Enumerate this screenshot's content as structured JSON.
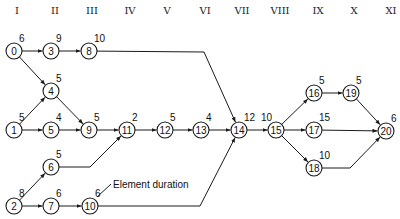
{
  "figure": {
    "annotation": {
      "text": "Element duration",
      "x": 113,
      "y": 188,
      "leader_from": [
        111,
        184
      ],
      "leader_to": [
        97,
        197
      ]
    }
  },
  "phases": [
    {
      "label": "I",
      "x": 17
    },
    {
      "label": "II",
      "x": 55
    },
    {
      "label": "III",
      "x": 92
    },
    {
      "label": "IV",
      "x": 130
    },
    {
      "label": "V",
      "x": 167
    },
    {
      "label": "VI",
      "x": 205
    },
    {
      "label": "VII",
      "x": 242
    },
    {
      "label": "VIII",
      "x": 280
    },
    {
      "label": "IX",
      "x": 318
    },
    {
      "label": "X",
      "x": 354
    },
    {
      "label": "XI",
      "x": 391
    }
  ],
  "nodes": [
    {
      "id": "0",
      "x": 14,
      "y": 51,
      "duration": "6"
    },
    {
      "id": "3",
      "x": 51,
      "y": 51,
      "duration": "9"
    },
    {
      "id": "8",
      "x": 89,
      "y": 51,
      "duration": "10"
    },
    {
      "id": "4",
      "x": 51,
      "y": 91,
      "duration": "5"
    },
    {
      "id": "1",
      "x": 14,
      "y": 130,
      "duration": "5"
    },
    {
      "id": "5",
      "x": 51,
      "y": 130,
      "duration": "4"
    },
    {
      "id": "9",
      "x": 89,
      "y": 130,
      "duration": "5"
    },
    {
      "id": "11",
      "x": 127,
      "y": 130,
      "duration": "2"
    },
    {
      "id": "12",
      "x": 165,
      "y": 130,
      "duration": "5"
    },
    {
      "id": "13",
      "x": 201,
      "y": 130,
      "duration": "4"
    },
    {
      "id": "14",
      "x": 239,
      "y": 130,
      "duration": "12"
    },
    {
      "id": "15",
      "x": 276,
      "y": 130,
      "duration": "10",
      "label_left": true
    },
    {
      "id": "16",
      "x": 314,
      "y": 93,
      "duration": "5"
    },
    {
      "id": "19",
      "x": 351,
      "y": 93,
      "duration": "5"
    },
    {
      "id": "17",
      "x": 314,
      "y": 130,
      "duration": "15"
    },
    {
      "id": "18",
      "x": 314,
      "y": 168,
      "duration": "10"
    },
    {
      "id": "20",
      "x": 386,
      "y": 131,
      "duration": "6"
    },
    {
      "id": "6",
      "x": 51,
      "y": 167,
      "duration": "5"
    },
    {
      "id": "2",
      "x": 14,
      "y": 206,
      "duration": "8"
    },
    {
      "id": "7",
      "x": 51,
      "y": 206,
      "duration": "6"
    },
    {
      "id": "10",
      "x": 90,
      "y": 206,
      "duration": "6"
    }
  ],
  "edges": [
    {
      "from": "0",
      "to": "3"
    },
    {
      "from": "3",
      "to": "8"
    },
    {
      "from": "0",
      "to": "4"
    },
    {
      "from": "1",
      "to": "4"
    },
    {
      "from": "1",
      "to": "5"
    },
    {
      "from": "4",
      "to": "9"
    },
    {
      "from": "5",
      "to": "9"
    },
    {
      "from": "9",
      "to": "11"
    },
    {
      "from": "6",
      "to": "11",
      "via": [
        [
          90,
          167
        ]
      ]
    },
    {
      "from": "11",
      "to": "12"
    },
    {
      "from": "12",
      "to": "13"
    },
    {
      "from": "13",
      "to": "14"
    },
    {
      "from": "8",
      "to": "14",
      "via": [
        [
          204,
          52
        ]
      ]
    },
    {
      "from": "10",
      "to": "14",
      "via": [
        [
          200,
          206
        ]
      ]
    },
    {
      "from": "14",
      "to": "15"
    },
    {
      "from": "15",
      "to": "16"
    },
    {
      "from": "15",
      "to": "17"
    },
    {
      "from": "15",
      "to": "18"
    },
    {
      "from": "16",
      "to": "19"
    },
    {
      "from": "19",
      "to": "20"
    },
    {
      "from": "17",
      "to": "20"
    },
    {
      "from": "18",
      "to": "20",
      "via": [
        [
          350,
          168
        ]
      ]
    },
    {
      "from": "2",
      "to": "6"
    },
    {
      "from": "2",
      "to": "7"
    },
    {
      "from": "7",
      "to": "10"
    }
  ],
  "style": {
    "line_color": "#1a1a1a",
    "node_radius": 8
  }
}
